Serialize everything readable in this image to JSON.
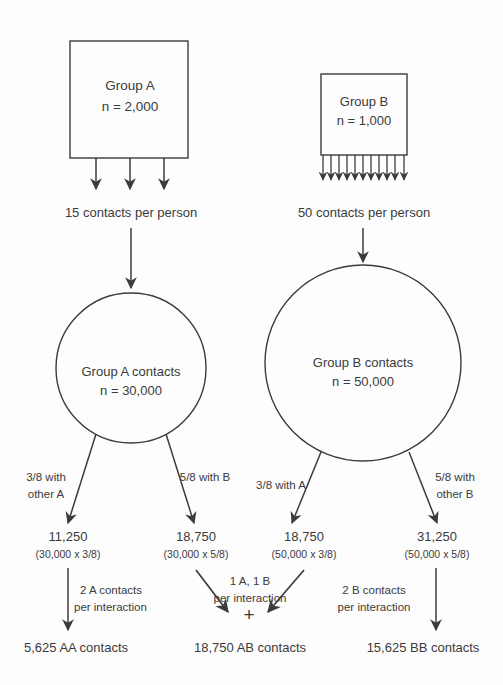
{
  "diagram": {
    "colors": {
      "stroke": "#3b3b3b",
      "text": "#3b3b3b",
      "background": "#fdfdfd"
    },
    "groups": [
      {
        "id": "A",
        "shape": "rectangle",
        "label": "Group A",
        "n_label": "n = 2,000",
        "n": 2000,
        "arrow_count": 3,
        "contacts_per_person_label": "15 contacts per person",
        "contacts_per_person": 15
      },
      {
        "id": "B",
        "shape": "rectangle",
        "label": "Group B",
        "n_label": "n = 1,000",
        "n": 1000,
        "arrow_count": 11,
        "contacts_per_person_label": "50 contacts per person",
        "contacts_per_person": 50
      }
    ],
    "contact_pools": [
      {
        "id": "A",
        "shape": "circle",
        "label": "Group A contacts",
        "n_label": "n = 30,000",
        "n": 30000
      },
      {
        "id": "B",
        "shape": "circle",
        "label": "Group B contacts",
        "n_label": "n = 50,000",
        "n": 50000
      }
    ],
    "splits": [
      {
        "from": "A",
        "edge_line1": "3/8 with",
        "edge_line2": "other A",
        "fraction": "3/8",
        "value_label": "11,250",
        "calc_label": "(30,000 x 3/8)",
        "value": 11250
      },
      {
        "from": "A",
        "edge_line1": "5/8 with B",
        "edge_line2": "",
        "fraction": "5/8",
        "value_label": "18,750",
        "calc_label": "(30,000 x 5/8)",
        "value": 18750
      },
      {
        "from": "B",
        "edge_line1": "3/8 with A",
        "edge_line2": "",
        "fraction": "3/8",
        "value_label": "18,750",
        "calc_label": "(50,000 x 3/8)",
        "value": 18750
      },
      {
        "from": "B",
        "edge_line1": "5/8 with",
        "edge_line2": "other B",
        "fraction": "5/8",
        "value_label": "31,250",
        "calc_label": "(50,000 x 5/8)",
        "value": 31250
      }
    ],
    "interaction_rules": [
      {
        "id": "aa",
        "line1": "2 A contacts",
        "line2": "per interaction"
      },
      {
        "id": "ab",
        "line1": "1 A, 1 B",
        "line2": "per interaction",
        "plus_symbol": "+"
      },
      {
        "id": "bb",
        "line1": "2 B contacts",
        "line2": "per interaction"
      }
    ],
    "outcomes": [
      {
        "id": "aa",
        "label": "5,625 AA contacts",
        "value": 5625
      },
      {
        "id": "ab",
        "label": "18,750 AB contacts",
        "value": 18750
      },
      {
        "id": "bb",
        "label": "15,625 BB contacts",
        "value": 15625
      }
    ]
  }
}
